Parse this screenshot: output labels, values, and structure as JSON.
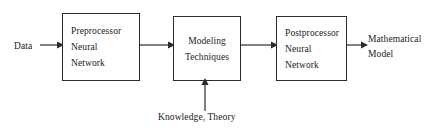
{
  "diagram": {
    "stroke_color": "#2b2b2b",
    "text_color": "#1a1a1a",
    "background_color": "#ffffff",
    "nodes": [
      {
        "id": "preprocessor",
        "lines": [
          "Preprocessor",
          "Neural",
          "Network"
        ],
        "line1": "Preprocessor",
        "line2": "Neural",
        "line3": "Network"
      },
      {
        "id": "modeling",
        "lines": [
          "Modeling",
          "Techniques"
        ],
        "line1": "Modeling",
        "line2": "Techniques"
      },
      {
        "id": "postprocessor",
        "lines": [
          "Postprocessor",
          "Neural",
          "Network"
        ],
        "line1": "Postprocessor",
        "line2": "Neural",
        "line3": "Network"
      }
    ],
    "labels": {
      "input": "Data",
      "output_line1": "Mathematical",
      "output_line2": "Model",
      "side_input": "Knowledge, Theory"
    },
    "edges": [
      {
        "id": "data-to-preprocessor",
        "from": "Data",
        "to": "Preprocessor Neural Network",
        "direction": "right"
      },
      {
        "id": "preprocessor-to-modeling",
        "from": "Preprocessor Neural Network",
        "to": "Modeling Techniques",
        "direction": "right"
      },
      {
        "id": "modeling-to-postprocessor",
        "from": "Modeling Techniques",
        "to": "Postprocessor Neural Network",
        "direction": "right"
      },
      {
        "id": "postprocessor-to-output",
        "from": "Postprocessor Neural Network",
        "to": "Mathematical Model",
        "direction": "right"
      },
      {
        "id": "knowledge-to-modeling",
        "from": "Knowledge, Theory",
        "to": "Modeling Techniques",
        "direction": "up"
      }
    ]
  }
}
